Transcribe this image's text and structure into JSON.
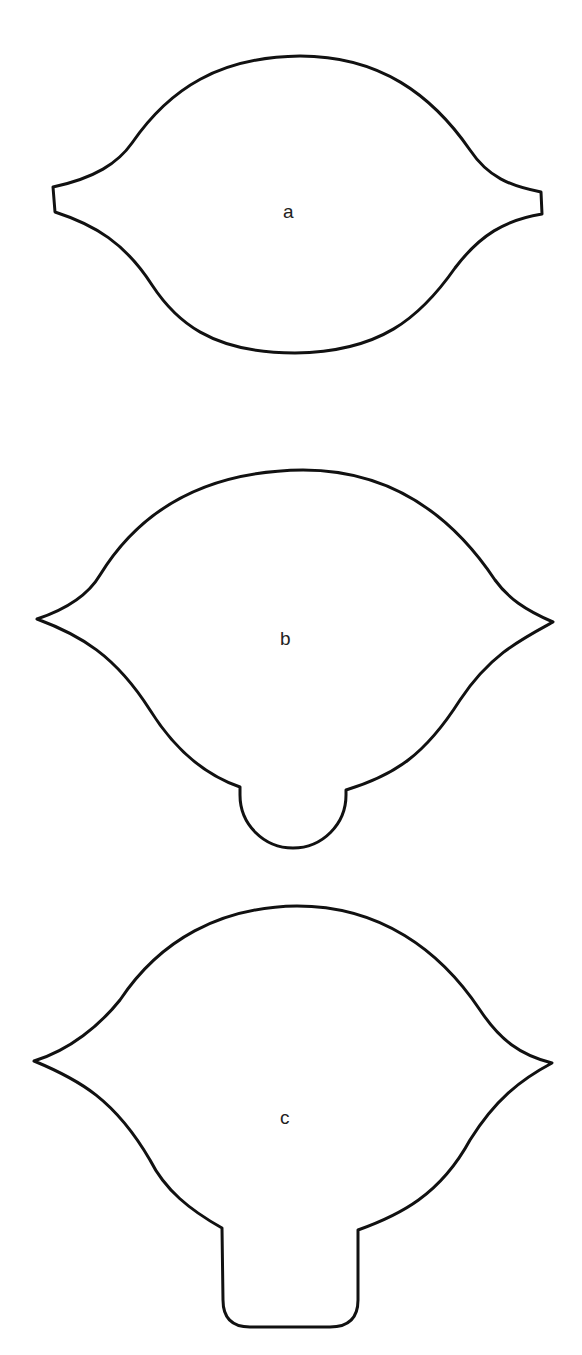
{
  "figure": {
    "stroke_color": "#111111",
    "background_color": "#ffffff",
    "shapes": [
      {
        "id": "a",
        "label": "a",
        "kind": "lens with flat truncated ends"
      },
      {
        "id": "b",
        "label": "b",
        "kind": "pointed lens with semicircular lobe at bottom"
      },
      {
        "id": "c",
        "label": "c",
        "kind": "pointed lens with rounded rectangular stem at bottom"
      }
    ]
  }
}
